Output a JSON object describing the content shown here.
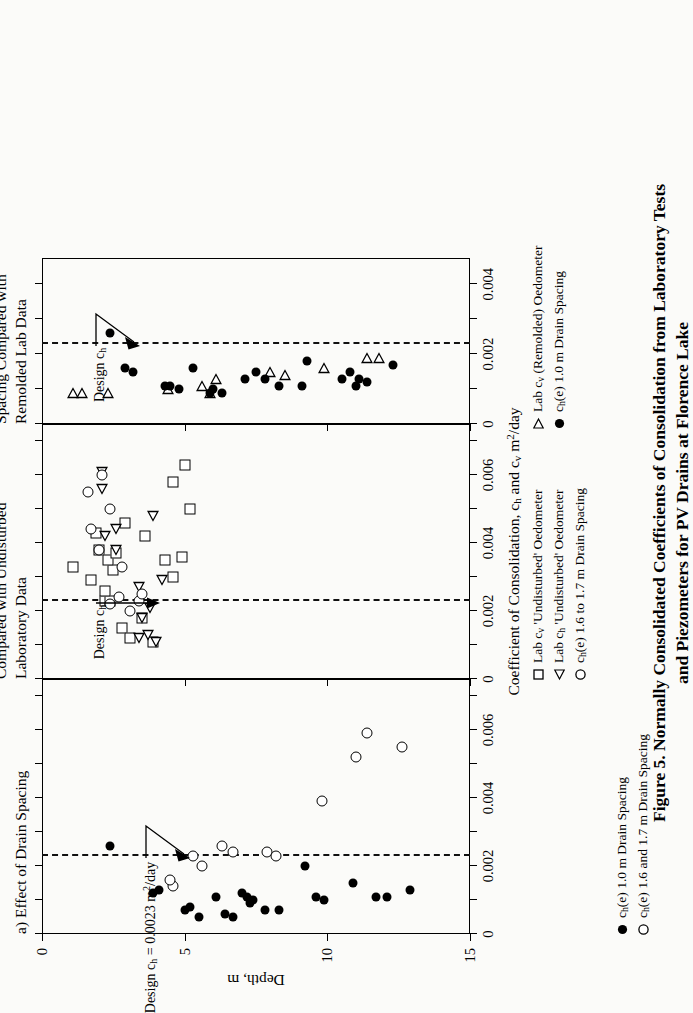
{
  "figure": {
    "caption_line1": "Figure 5.  Normally Consolidated Coefficients of Consolidation from Laboratory Tests",
    "caption_line2": "and Piezometers for PV Drains at Florence Lake"
  },
  "axes": {
    "y_title": "Depth, m",
    "y_ticks": [
      "0",
      "5",
      "10",
      "15"
    ],
    "x_title_main": "Coefficient of Consolidation, c",
    "x_title_sub1": "h",
    "x_title_mid": " and c",
    "x_title_sub2": "v",
    "x_title_units": " m",
    "x_title_unit_exp": "2",
    "x_title_unit_tail": "/day",
    "x_title_full": "Coefficient of Consolidation, ch and cv m2/day"
  },
  "panels": [
    {
      "id": "a",
      "title": "a)  Effect of Drain Spacing",
      "x_ticks": [
        "0",
        "0.002",
        "0.004",
        "0.006"
      ],
      "x_max": 0.0075,
      "annotation": "Design c",
      "annotation_sub": "h",
      "annotation_rest": " = 0.0023 m",
      "annotation_exp": "2",
      "annotation_tail": "/day",
      "annotation_full": "Design ch = 0.0023 m2/day",
      "design_value": 0.0023
    },
    {
      "id": "b",
      "title": "b)   Field Data at Large Spacing\n     Compared with Undisturbed\n     Laboratory Data",
      "x_ticks": [
        "0",
        "0.002",
        "0.004",
        "0.006"
      ],
      "x_max": 0.0075,
      "annotation_full": "Design ch",
      "annotation": "Design c",
      "annotation_sub": "h",
      "design_value": 0.0023
    },
    {
      "id": "c",
      "title": "c)  Field Data at Small\n     Spacing Compared with\n     Remolded Lab Data",
      "x_ticks": [
        "0",
        "0.002",
        "0.004"
      ],
      "x_max": 0.00475,
      "annotation_full": "Design ch",
      "annotation": "Design c",
      "annotation_sub": "h",
      "design_value": 0.0023
    }
  ],
  "legend": {
    "panel_a": [
      {
        "symbol": "filled-circle",
        "label_main": "c",
        "label_sub": "h",
        "label_rest": "(e) 1.0 m Drain Spacing",
        "label_full": "ch(e) 1.0 m Drain Spacing"
      },
      {
        "symbol": "open-circle",
        "label_main": "c",
        "label_sub": "h",
        "label_rest": "(e) 1.6 and 1.7 m Drain Spacing",
        "label_full": "ch(e) 1.6 and 1.7 m Drain Spacing"
      }
    ],
    "panel_bc": [
      {
        "symbol": "open-square",
        "label_main": "Lab c",
        "label_sub": "v",
        "label_rest": " 'Undisturbed' Oedometer",
        "label_full": "Lab cv 'Undisturbed' Oedometer"
      },
      {
        "symbol": "open-triangle-left",
        "label_main": "Lab c",
        "label_sub": "h",
        "label_rest": " 'Undisturbed' Oedometer",
        "label_full": "Lab ch 'Undisturbed' Oedometer"
      },
      {
        "symbol": "open-circle",
        "label_main": "c",
        "label_sub": "h",
        "label_rest": "(e) 1.6 to 1.7 m Drain Spacing",
        "label_full": "ch(e) 1.6 to 1.7 m Drain Spacing"
      },
      {
        "symbol": "open-triangle-right",
        "label_main": "Lab c",
        "label_sub": "v",
        "label_rest": " (Remolded) Oedometer",
        "label_full": "Lab cv (Remolded) Oedometer"
      },
      {
        "symbol": "filled-circle",
        "label_main": "c",
        "label_sub": "h",
        "label_rest": "(e) 1.0 m Drain Spacing",
        "label_full": "ch(e) 1.0 m Drain Spacing"
      }
    ]
  },
  "chart_data": {
    "type": "scatter",
    "xlabel": "Coefficient of Consolidation, ch and cv m2/day",
    "ylabel": "Depth, m",
    "ylim": [
      0,
      15
    ],
    "y_ticks": [
      0,
      5,
      10,
      15
    ],
    "grid": false,
    "legend_position": "below-axes",
    "panels": [
      {
        "id": "a",
        "label": "a) Effect of Drain Spacing",
        "xlim": [
          0,
          0.0075
        ],
        "x_ticks": [
          0,
          0.002,
          0.004,
          0.006
        ],
        "design_ch": 0.0023,
        "series": [
          {
            "name": "ch(e) 1.0 m Drain Spacing",
            "marker": "filled-circle",
            "points": [
              [
                0.0026,
                2.4
              ],
              [
                0.0012,
                3.9
              ],
              [
                0.0013,
                4.1
              ],
              [
                0.0007,
                5.0
              ],
              [
                0.0008,
                5.2
              ],
              [
                0.0005,
                5.5
              ],
              [
                0.0011,
                6.1
              ],
              [
                0.0006,
                6.4
              ],
              [
                0.0005,
                6.7
              ],
              [
                0.0009,
                7.3
              ],
              [
                0.0011,
                7.2
              ],
              [
                0.0012,
                7.0
              ],
              [
                0.001,
                7.4
              ],
              [
                0.0007,
                7.8
              ],
              [
                0.0007,
                8.3
              ],
              [
                0.002,
                9.2
              ],
              [
                0.0011,
                9.6
              ],
              [
                0.001,
                9.9
              ],
              [
                0.0015,
                10.9
              ],
              [
                0.0011,
                11.7
              ],
              [
                0.0011,
                12.1
              ],
              [
                0.0013,
                12.9
              ]
            ]
          },
          {
            "name": "ch(e) 1.6 and 1.7 m Drain Spacing",
            "marker": "open-circle",
            "points": [
              [
                0.0014,
                4.6
              ],
              [
                0.0016,
                4.5
              ],
              [
                0.0023,
                5.3
              ],
              [
                0.002,
                5.6
              ],
              [
                0.0026,
                6.3
              ],
              [
                0.0024,
                6.7
              ],
              [
                0.0024,
                7.9
              ],
              [
                0.0023,
                8.2
              ],
              [
                0.0039,
                9.8
              ],
              [
                0.0052,
                11.0
              ],
              [
                0.0059,
                11.4
              ],
              [
                0.0055,
                12.6
              ]
            ]
          }
        ]
      },
      {
        "id": "b",
        "label": "b) Field Data at Large Spacing Compared with Undisturbed Laboratory Data",
        "xlim": [
          0,
          0.0075
        ],
        "x_ticks": [
          0,
          0.002,
          0.004,
          0.006
        ],
        "design_ch": 0.0023,
        "series": [
          {
            "name": "Lab cv 'Undisturbed' Oedometer",
            "marker": "open-square",
            "points": [
              [
                0.0033,
                1.1
              ],
              [
                0.0029,
                1.7
              ],
              [
                0.0023,
                2.2
              ],
              [
                0.0015,
                2.8
              ],
              [
                0.0012,
                3.1
              ],
              [
                0.0018,
                3.5
              ],
              [
                0.0011,
                3.9
              ],
              [
                0.0023,
                2.4
              ],
              [
                0.0026,
                2.2
              ],
              [
                0.0032,
                2.5
              ],
              [
                0.0038,
                2.0
              ],
              [
                0.0035,
                2.3
              ],
              [
                0.0037,
                2.6
              ],
              [
                0.0043,
                1.9
              ],
              [
                0.0046,
                2.9
              ],
              [
                0.0042,
                3.6
              ],
              [
                0.0035,
                4.3
              ],
              [
                0.003,
                4.6
              ],
              [
                0.0036,
                4.9
              ],
              [
                0.0058,
                4.6
              ],
              [
                0.005,
                5.2
              ],
              [
                0.0063,
                5.0
              ]
            ]
          },
          {
            "name": "Lab ch 'Undisturbed' Oedometer",
            "marker": "open-triangle-left",
            "points": [
              [
                0.0012,
                3.4
              ],
              [
                0.0013,
                3.7
              ],
              [
                0.0011,
                4.0
              ],
              [
                0.0018,
                3.5
              ],
              [
                0.0021,
                3.8
              ],
              [
                0.0027,
                3.4
              ],
              [
                0.0038,
                2.6
              ],
              [
                0.0042,
                2.2
              ],
              [
                0.0044,
                2.6
              ],
              [
                0.0048,
                3.9
              ],
              [
                0.0056,
                2.1
              ],
              [
                0.0061,
                2.1
              ],
              [
                0.0029,
                4.2
              ]
            ]
          },
          {
            "name": "ch(e) 1.6 to 1.7 m Drain Spacing",
            "marker": "open-circle",
            "points": [
              [
                0.002,
                3.1
              ],
              [
                0.0024,
                2.7
              ],
              [
                0.0022,
                2.4
              ],
              [
                0.0023,
                3.4
              ],
              [
                0.0025,
                3.5
              ],
              [
                0.0033,
                2.8
              ],
              [
                0.0038,
                2.0
              ],
              [
                0.0044,
                1.7
              ],
              [
                0.005,
                2.4
              ],
              [
                0.0055,
                1.6
              ],
              [
                0.006,
                2.1
              ]
            ]
          }
        ]
      },
      {
        "id": "c",
        "label": "c) Field Data at Small Spacing Compared with Remolded Lab Data",
        "xlim": [
          0,
          0.00475
        ],
        "x_ticks": [
          0,
          0.002,
          0.004
        ],
        "design_ch": 0.0023,
        "series": [
          {
            "name": "Lab cv (Remolded) Oedometer",
            "marker": "open-triangle-right",
            "points": [
              [
                0.0009,
                1.1
              ],
              [
                0.0009,
                1.4
              ],
              [
                0.0009,
                2.3
              ],
              [
                0.001,
                4.4
              ],
              [
                0.0011,
                5.6
              ],
              [
                0.0009,
                5.9
              ],
              [
                0.0013,
                6.1
              ],
              [
                0.0015,
                8.0
              ],
              [
                0.0014,
                8.5
              ],
              [
                0.0016,
                9.9
              ],
              [
                0.0019,
                11.4
              ],
              [
                0.0019,
                11.8
              ]
            ]
          },
          {
            "name": "ch(e) 1.0 m Drain Spacing",
            "marker": "filled-circle",
            "points": [
              [
                0.0026,
                2.4
              ],
              [
                0.0016,
                2.9
              ],
              [
                0.0015,
                3.2
              ],
              [
                0.0011,
                4.3
              ],
              [
                0.0011,
                4.5
              ],
              [
                0.001,
                4.8
              ],
              [
                0.0009,
                5.9
              ],
              [
                0.0016,
                5.3
              ],
              [
                0.001,
                6.0
              ],
              [
                0.0009,
                6.3
              ],
              [
                0.0013,
                7.1
              ],
              [
                0.0015,
                7.5
              ],
              [
                0.0013,
                7.8
              ],
              [
                0.0011,
                8.3
              ],
              [
                0.0018,
                9.3
              ],
              [
                0.0011,
                9.1
              ],
              [
                0.0013,
                10.5
              ],
              [
                0.0015,
                10.8
              ],
              [
                0.0013,
                11.1
              ],
              [
                0.0012,
                11.4
              ],
              [
                0.0017,
                12.3
              ],
              [
                0.0011,
                11.0
              ]
            ]
          }
        ]
      }
    ]
  }
}
